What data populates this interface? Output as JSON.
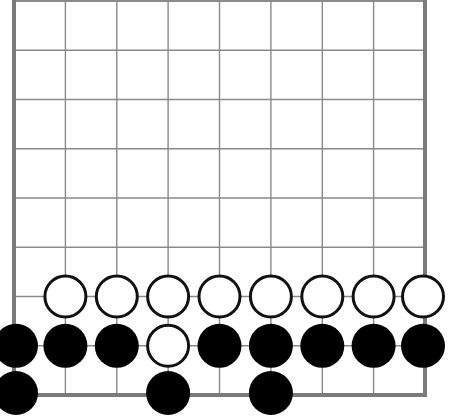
{
  "diagram": {
    "colors": {
      "background": "#ffffff",
      "grid_line": "#8a8a8a",
      "edge_line": "#7a7a7a",
      "black_stone": "#000000",
      "white_stone_fill": "#ffffff",
      "white_stone_outline": "#111111"
    },
    "grid": {
      "columns": 9,
      "rows": 9,
      "x_positions": [
        14,
        65.4,
        116.8,
        168.1,
        219.5,
        270.9,
        322.3,
        373.6,
        425
      ],
      "y_positions": [
        1,
        50.3,
        99.5,
        148.8,
        198,
        247.3,
        296.5,
        345.8,
        395
      ],
      "edges": {
        "left": true,
        "right": true,
        "bottom": true,
        "top": false
      }
    },
    "stone_radius": 22,
    "stones": [
      {
        "color": "white",
        "col": 2,
        "row": 7
      },
      {
        "color": "white",
        "col": 3,
        "row": 7
      },
      {
        "color": "white",
        "col": 4,
        "row": 7
      },
      {
        "color": "white",
        "col": 5,
        "row": 7
      },
      {
        "color": "white",
        "col": 6,
        "row": 7
      },
      {
        "color": "white",
        "col": 7,
        "row": 7
      },
      {
        "color": "white",
        "col": 8,
        "row": 7
      },
      {
        "color": "white",
        "col": 9,
        "row": 7
      },
      {
        "color": "black",
        "col": 1,
        "row": 8
      },
      {
        "color": "black",
        "col": 2,
        "row": 8
      },
      {
        "color": "black",
        "col": 3,
        "row": 8
      },
      {
        "color": "white",
        "col": 4,
        "row": 8
      },
      {
        "color": "black",
        "col": 5,
        "row": 8
      },
      {
        "color": "black",
        "col": 6,
        "row": 8
      },
      {
        "color": "black",
        "col": 7,
        "row": 8
      },
      {
        "color": "black",
        "col": 8,
        "row": 8
      },
      {
        "color": "black",
        "col": 9,
        "row": 8
      },
      {
        "color": "black",
        "col": 1,
        "row": 9
      },
      {
        "color": "black",
        "col": 4,
        "row": 9
      },
      {
        "color": "black",
        "col": 6,
        "row": 9
      }
    ]
  }
}
